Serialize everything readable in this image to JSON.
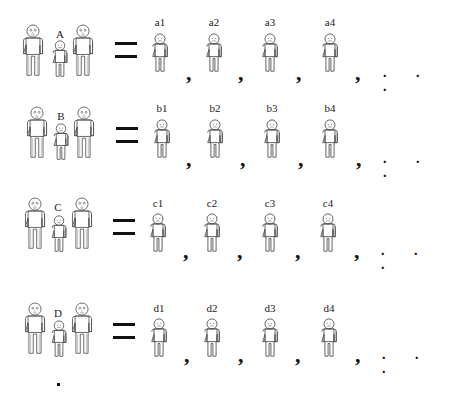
{
  "diagram": {
    "type": "family-equals-sequence",
    "rows": [
      {
        "family_label": "A",
        "operator": "=",
        "children": [
          "a1",
          "a2",
          "a3",
          "a4"
        ],
        "separator": ",",
        "continuation": ". . ."
      },
      {
        "family_label": "B",
        "operator": "=",
        "children": [
          "b1",
          "b2",
          "b3",
          "b4"
        ],
        "separator": ",",
        "continuation": ". . ."
      },
      {
        "family_label": "C",
        "operator": "=",
        "children": [
          "c1",
          "c2",
          "c3",
          "c4"
        ],
        "separator": ",",
        "continuation": ". . ."
      },
      {
        "family_label": "D",
        "operator": "=",
        "children": [
          "d1",
          "d2",
          "d3",
          "d4"
        ],
        "separator": ",",
        "continuation": ". . ."
      }
    ],
    "trailing_mark": ".",
    "icons": {
      "adult": "adult-person-icon",
      "child": "child-person-icon"
    },
    "colors": {
      "stroke": "#555555",
      "text": "#111111",
      "background": "#ffffff"
    }
  }
}
